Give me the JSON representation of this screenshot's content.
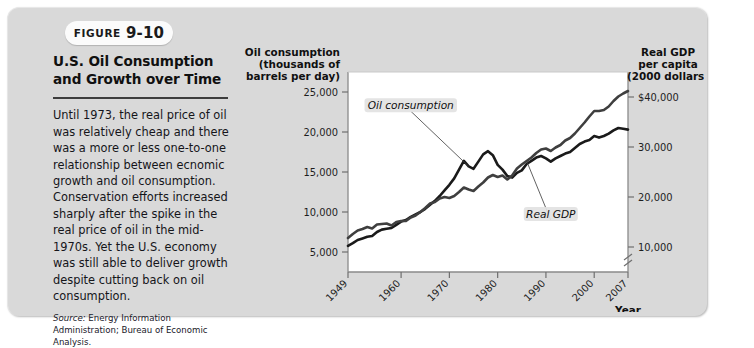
{
  "figure": {
    "badge_label": "FIGURE",
    "badge_number": "9-10",
    "title": "U.S. Oil Consumption and Growth over Time",
    "body": "Until 1973, the real price of oil was relatively cheap and there was a more or less one-to-one relationship between ecnomic growth and oil consumption. Conservation efforts increased sharply after the spike in the real price of oil in the mid-1970s. Yet the U.S. economy was still able to deliver growth despite cutting back on oil consumption.",
    "source_prefix": "Source:",
    "source_text": "Energy Information Administration; Bureau of Economic Analysis."
  },
  "chart_data": {
    "type": "line",
    "title": "",
    "xlabel": "Year",
    "ylabel": "Oil consumption (thousands of barrels per day)",
    "y2label": "Real GDP per capita (2000 dollars)",
    "left_axis_title_lines": [
      "Oil consumption",
      "(thousands of",
      "barrels per day)"
    ],
    "right_axis_title_lines": [
      "Real GDP",
      "per capita",
      "(2000 dollars)"
    ],
    "x_ticks": [
      "1949",
      "1960",
      "1970",
      "1980",
      "1990",
      "2000",
      "2007"
    ],
    "x_tick_years": [
      1949,
      1960,
      1970,
      1980,
      1990,
      2000,
      2007
    ],
    "xlim": [
      1949,
      2007
    ],
    "left_ticks": [
      "5,000",
      "10,000",
      "15,000",
      "20,000",
      "25,000"
    ],
    "left_tick_values": [
      5000,
      10000,
      15000,
      20000,
      25000
    ],
    "left_ylim": [
      2500,
      27500
    ],
    "right_ticks": [
      "10,000",
      "20,000",
      "30,000",
      "$40,000"
    ],
    "right_tick_values": [
      10000,
      20000,
      30000,
      40000
    ],
    "right_ylim": [
      5000,
      45000
    ],
    "right_axis_break": true,
    "grid": false,
    "legend_position": "inline-annotations",
    "series": [
      {
        "name": "Oil consumption",
        "axis": "left",
        "color": "#1a1a1a",
        "width": 2.6,
        "label_x": 1962,
        "label_y": 23100,
        "x": [
          1949,
          1950,
          1951,
          1952,
          1953,
          1954,
          1955,
          1956,
          1957,
          1958,
          1959,
          1960,
          1961,
          1962,
          1963,
          1964,
          1965,
          1966,
          1967,
          1968,
          1969,
          1970,
          1971,
          1972,
          1973,
          1974,
          1975,
          1976,
          1977,
          1978,
          1979,
          1980,
          1981,
          1982,
          1983,
          1984,
          1985,
          1986,
          1987,
          1988,
          1989,
          1990,
          1991,
          1992,
          1993,
          1994,
          1995,
          1996,
          1997,
          1998,
          1999,
          2000,
          2001,
          2002,
          2003,
          2004,
          2005,
          2006,
          2007
        ],
        "y": [
          5760,
          6100,
          6500,
          6700,
          6900,
          7000,
          7500,
          7800,
          7900,
          8000,
          8400,
          8800,
          9000,
          9400,
          9700,
          10000,
          10400,
          10900,
          11400,
          12000,
          12700,
          13400,
          14200,
          15300,
          16400,
          15700,
          15400,
          16300,
          17200,
          17600,
          17100,
          15900,
          15300,
          14500,
          14300,
          14900,
          15200,
          16000,
          16400,
          16800,
          17000,
          16700,
          16300,
          16700,
          17000,
          17300,
          17500,
          18000,
          18500,
          18800,
          19000,
          19500,
          19300,
          19500,
          19800,
          20200,
          20500,
          20400,
          20300
        ]
      },
      {
        "name": "Real GDP",
        "axis": "right",
        "color": "#3f3f3f",
        "width": 2.6,
        "label_x": 1991,
        "label_y": 16200,
        "x": [
          1949,
          1950,
          1951,
          1952,
          1953,
          1954,
          1955,
          1956,
          1957,
          1958,
          1959,
          1960,
          1961,
          1962,
          1963,
          1964,
          1965,
          1966,
          1967,
          1968,
          1969,
          1970,
          1971,
          1972,
          1973,
          1974,
          1975,
          1976,
          1977,
          1978,
          1979,
          1980,
          1981,
          1982,
          1983,
          1984,
          1985,
          1986,
          1987,
          1988,
          1989,
          1990,
          1991,
          1992,
          1993,
          1994,
          1995,
          1996,
          1997,
          1998,
          1999,
          2000,
          2001,
          2002,
          2003,
          2004,
          2005,
          2006,
          2007
        ],
        "y": [
          11800,
          12600,
          13300,
          13600,
          14000,
          13700,
          14500,
          14600,
          14700,
          14300,
          15000,
          15200,
          15200,
          15900,
          16300,
          17000,
          17800,
          18700,
          19000,
          19700,
          20000,
          19800,
          20200,
          21000,
          21900,
          21500,
          21200,
          22100,
          22900,
          23900,
          24400,
          24000,
          24300,
          23500,
          24300,
          25700,
          26500,
          27200,
          27900,
          28800,
          29500,
          29700,
          29200,
          29900,
          30400,
          31300,
          31800,
          32700,
          33800,
          34900,
          36100,
          37200,
          37200,
          37400,
          38100,
          39200,
          40100,
          40700,
          41200
        ]
      }
    ]
  }
}
